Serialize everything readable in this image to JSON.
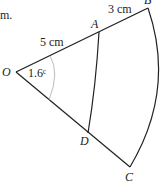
{
  "diagram": {
    "leading_text": "m.",
    "points": {
      "O": "O",
      "A": "A",
      "B": "B",
      "C": "C",
      "D": "D"
    },
    "lengths": {
      "OA": "5 cm",
      "AB": "3 cm"
    },
    "angle": "1.6ᶜ",
    "colors": {
      "line": "#222222",
      "angle_arc": "#aaaaaa"
    }
  }
}
